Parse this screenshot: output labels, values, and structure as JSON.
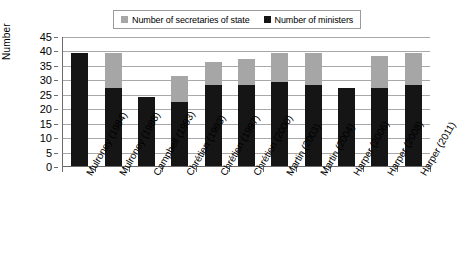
{
  "chart_data": {
    "type": "bar",
    "stacked": true,
    "title": "",
    "xlabel": "",
    "ylabel": "Number",
    "ylim": [
      0,
      45
    ],
    "ytick_step": 5,
    "yticks": [
      45,
      40,
      35,
      30,
      25,
      20,
      15,
      10,
      5,
      0
    ],
    "grid": true,
    "legend_position": "top-center",
    "categories": [
      "Mulroney (1984)",
      "Mulroney (1988)",
      "Campbell (1993)",
      "Chrétien (1993)",
      "Chrétien (1997)",
      "Chrétien (2000)",
      "Martin (2003)",
      "Martin (2004)",
      "Harper (2006)",
      "Harper (2008)",
      "Harper (2011)"
    ],
    "series": [
      {
        "name": "Number of ministers",
        "color": "#151515",
        "values": [
          39,
          27,
          24,
          22,
          28,
          28,
          29,
          28,
          27,
          27,
          28
        ]
      },
      {
        "name": "Number of secretaries of state",
        "color": "#a6a6a6",
        "values": [
          0,
          12,
          0,
          9,
          8,
          9,
          10,
          11,
          0,
          11,
          11
        ]
      }
    ],
    "totals": [
      39,
      39,
      24,
      31,
      36,
      37,
      39,
      39,
      27,
      38,
      39
    ]
  },
  "legend": {
    "items": [
      {
        "label": "Number of secretaries of state",
        "color": "#a6a6a6"
      },
      {
        "label": "Number of ministers",
        "color": "#151515"
      }
    ]
  },
  "axes": {
    "y_title": "Number"
  }
}
